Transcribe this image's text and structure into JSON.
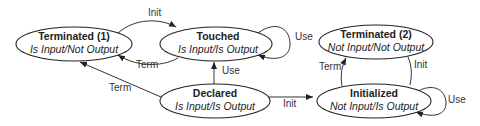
{
  "diagram": {
    "type": "state-transition",
    "nodes": {
      "terminated1": {
        "title": "Terminated (1)",
        "subtitle": "Is Input/Not Output"
      },
      "touched": {
        "title": "Touched",
        "subtitle": "Is Input/Is Output"
      },
      "declared": {
        "title": "Declared",
        "subtitle": "Is Input/Is Output"
      },
      "terminated2": {
        "title": "Terminated (2)",
        "subtitle": "Not Input/Not Output"
      },
      "initialized": {
        "title": "Initialized",
        "subtitle": "Not Input/Is Output"
      }
    },
    "edges": {
      "t1_to_touched": {
        "from": "Terminated (1)",
        "to": "Touched",
        "label": "Init"
      },
      "touched_to_t1": {
        "from": "Touched",
        "to": "Terminated (1)",
        "label": "Term"
      },
      "touched_self": {
        "from": "Touched",
        "to": "Touched",
        "label": "Use"
      },
      "declared_to_touched": {
        "from": "Declared",
        "to": "Touched",
        "label": "Use"
      },
      "declared_to_t1": {
        "from": "Declared",
        "to": "Terminated (1)",
        "label": "Term"
      },
      "declared_to_initialized": {
        "from": "Declared",
        "to": "Initialized",
        "label": "Init"
      },
      "initialized_to_t2": {
        "from": "Initialized",
        "to": "Terminated (2)",
        "label": "Term"
      },
      "t2_to_initialized": {
        "from": "Terminated (2)",
        "to": "Initialized",
        "label": "Init"
      },
      "initialized_self": {
        "from": "Initialized",
        "to": "Initialized",
        "label": "Use"
      }
    }
  }
}
